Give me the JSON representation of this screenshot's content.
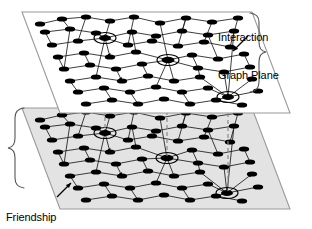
{
  "figure": {
    "kind": "diagram",
    "background_color": "#ffffff"
  },
  "labels": {
    "interaction": {
      "line1": "Interaction",
      "line2": "Graph Plane",
      "color": "#000000"
    },
    "friendship": {
      "line1": "Friendship",
      "line2": "Graph Plane",
      "color": "#000000"
    }
  },
  "planes": [
    {
      "id": "interaction-plane",
      "name": "Interaction Graph Plane",
      "fill": "#ffffff",
      "stroke": "#9a9a9a",
      "corners": [
        [
          22,
          12
        ],
        [
          252,
          12
        ],
        [
          290,
          113
        ],
        [
          60,
          113
        ]
      ]
    },
    {
      "id": "friendship-plane",
      "name": "Friendship Graph Plane",
      "fill": "#e3e3e3",
      "stroke": "#9a9a9a",
      "corners": [
        [
          22,
          108
        ],
        [
          252,
          108
        ],
        [
          290,
          209
        ],
        [
          60,
          209
        ]
      ]
    }
  ],
  "node_style": {
    "fill": "#000000",
    "rx": 5.2,
    "ry": 2.6,
    "edge_stroke": "#1a1a1a"
  },
  "highlight_style": {
    "stroke": "#000000",
    "fill": "none",
    "rx": 11,
    "ry": 5.5
  },
  "connector_style": {
    "stroke": "#7a7a7a",
    "dash": "4 3"
  },
  "highlighted_nodes": {
    "interaction": [
      [
        105,
        38
      ],
      [
        168,
        60
      ],
      [
        228,
        97
      ]
    ],
    "friendship": [
      [
        105,
        133
      ],
      [
        167,
        158
      ],
      [
        227,
        193
      ]
    ]
  },
  "connectors": [
    {
      "x": 105,
      "y1": 40,
      "y2": 131
    },
    {
      "x": 167,
      "y1": 62,
      "y2": 156
    },
    {
      "x": 228,
      "y1": 99,
      "y2": 191
    }
  ],
  "graph": {
    "interaction_node_count": 74,
    "friendship_node_count": 74,
    "description": "Dense directed network of ellipse nodes with arrow-marked edges drawn on each plane"
  },
  "braces": {
    "interaction": {
      "position": "top-right",
      "name": "interaction-brace"
    },
    "friendship": {
      "position": "bottom-left",
      "name": "friendship-brace"
    }
  },
  "arrows": {
    "interaction": {
      "from": [
        248,
        38
      ],
      "to": [
        232,
        52
      ],
      "name": "interaction-arrow"
    },
    "friendship": {
      "from": [
        58,
        196
      ],
      "to": [
        72,
        182
      ],
      "name": "friendship-arrow"
    }
  }
}
